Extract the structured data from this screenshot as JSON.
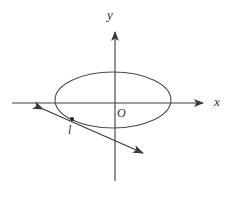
{
  "figure": {
    "type": "geometry-diagram",
    "background_color": "#ffffff",
    "stroke_color": "#3a3a3a",
    "labels": {
      "y_axis": "y",
      "x_axis": "x",
      "origin": "O",
      "line": "l"
    },
    "axes": {
      "x_axis": {
        "name": "x-axis",
        "start": [
          12,
          103
        ],
        "end": [
          208,
          103
        ],
        "arrow": "right"
      },
      "y_axis": {
        "name": "y-axis",
        "start": [
          115,
          181
        ],
        "end": [
          115,
          27
        ],
        "arrow": "up"
      }
    },
    "ellipse": {
      "name": "ellipse",
      "center": [
        113,
        100
      ],
      "radius_x": 58,
      "radius_y": 28
    },
    "line": {
      "name": "line-l",
      "label": "l",
      "start": [
        36,
        106
      ],
      "end": [
        150,
        157
      ],
      "arrows": "both"
    },
    "marked_point": {
      "name": "marked-point",
      "position": [
        72,
        119
      ]
    }
  }
}
